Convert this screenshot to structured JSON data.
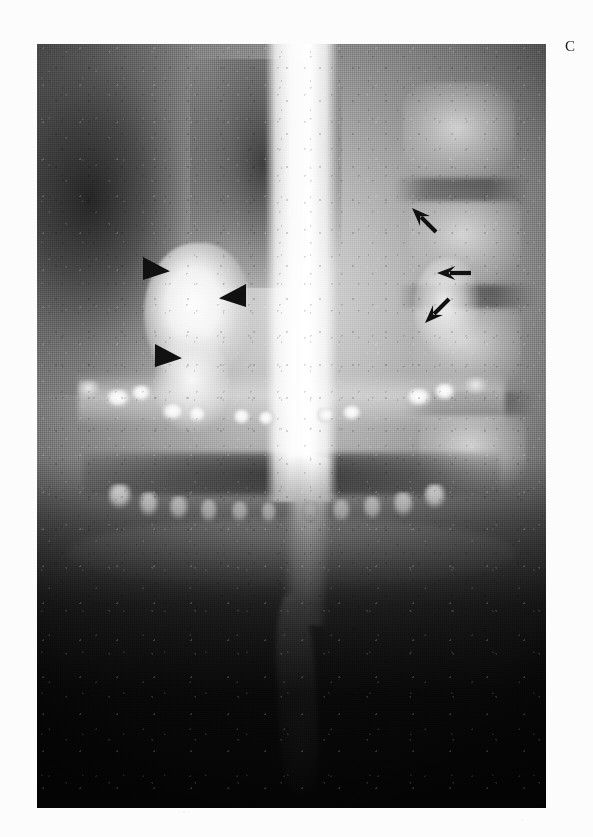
{
  "figure": {
    "panel_label": "C",
    "modality": "panoramic radiograph with barium contrast column",
    "plate": {
      "left": 37,
      "top": 44,
      "width": 509,
      "height": 764,
      "background_color": "#0a0a0a"
    },
    "page_background_color": "#fcfcfc",
    "ink_color": "#111111"
  },
  "annotations": {
    "arrowheads": [
      {
        "name": "arrowhead-1",
        "direction": "right",
        "x": 106,
        "y": 213,
        "size": 27
      },
      {
        "name": "arrowhead-2",
        "direction": "left",
        "x": 182,
        "y": 240,
        "size": 27
      },
      {
        "name": "arrowhead-3",
        "direction": "right",
        "x": 118,
        "y": 300,
        "size": 27
      }
    ],
    "arrows": [
      {
        "name": "arrow-1",
        "direction": "down-left",
        "rotation": 225,
        "x": 370,
        "y": 168,
        "length": 34
      },
      {
        "name": "arrow-2",
        "direction": "left",
        "rotation": 180,
        "x": 400,
        "y": 221,
        "length": 34
      },
      {
        "name": "arrow-3",
        "direction": "up-left",
        "rotation": 135,
        "x": 383,
        "y": 259,
        "length": 34
      }
    ]
  },
  "anatomy": {
    "barium_column": {
      "name": "central-contrast-column",
      "description": "bright vertical barium-filled column descending the midline"
    },
    "left_lesion": {
      "name": "radiodense-lesion-left",
      "description": "well-defined dense lesion marked by three arrowheads"
    },
    "right_lesion": {
      "name": "soft-tissue-density-right",
      "description": "density adjacent to cervical spine marked by three arrows"
    },
    "cervical_spine": {
      "name": "cervical-vertebrae",
      "bodies": [
        {
          "left": 72,
          "top": 5,
          "width": 22,
          "height": 13
        },
        {
          "left": 73,
          "top": 19,
          "width": 22,
          "height": 13
        },
        {
          "left": 74,
          "top": 33,
          "width": 21,
          "height": 13
        },
        {
          "left": 75,
          "top": 47,
          "width": 21,
          "height": 12
        }
      ],
      "gaps": [
        {
          "left": 70,
          "top": 17.5,
          "width": 27,
          "height": 3
        },
        {
          "left": 71,
          "top": 31.5,
          "width": 27,
          "height": 3
        },
        {
          "left": 72,
          "top": 45.5,
          "width": 26,
          "height": 3
        }
      ]
    },
    "upper_teeth": [
      {
        "left": 13.5,
        "top": 45.2,
        "width": 5.0,
        "height": 2.6,
        "bright": true
      },
      {
        "left": 18.4,
        "top": 44.6,
        "width": 4.2,
        "height": 2.4,
        "bright": true
      },
      {
        "left": 24.5,
        "top": 47.0,
        "width": 4.6,
        "height": 2.5,
        "bright": true
      },
      {
        "left": 29.6,
        "top": 47.4,
        "width": 3.8,
        "height": 2.3,
        "bright": true
      },
      {
        "left": 38.5,
        "top": 47.8,
        "width": 3.6,
        "height": 2.2,
        "bright": true
      },
      {
        "left": 43.4,
        "top": 48.0,
        "width": 3.4,
        "height": 2.1,
        "bright": true
      },
      {
        "left": 55.0,
        "top": 47.6,
        "width": 3.6,
        "height": 2.2,
        "bright": true
      },
      {
        "left": 60.0,
        "top": 47.2,
        "width": 3.8,
        "height": 2.3,
        "bright": true
      },
      {
        "left": 72.5,
        "top": 45.0,
        "width": 5.2,
        "height": 2.6,
        "bright": true
      },
      {
        "left": 78.0,
        "top": 44.4,
        "width": 4.4,
        "height": 2.4,
        "bright": true
      },
      {
        "left": 8.0,
        "top": 44.0,
        "width": 4.4,
        "height": 2.4,
        "bright": false
      },
      {
        "left": 84.0,
        "top": 43.6,
        "width": 4.4,
        "height": 2.4,
        "bright": false
      }
    ],
    "lower_teeth": [
      {
        "left": 14.0,
        "top": 57.6,
        "width": 4.6,
        "height": 3.4,
        "bright": true
      },
      {
        "left": 20.0,
        "top": 58.6,
        "width": 4.0,
        "height": 3.4,
        "bright": true
      },
      {
        "left": 26.0,
        "top": 59.2,
        "width": 3.8,
        "height": 3.2,
        "bright": true
      },
      {
        "left": 32.0,
        "top": 59.6,
        "width": 3.6,
        "height": 3.2,
        "bright": true
      },
      {
        "left": 38.2,
        "top": 59.8,
        "width": 3.4,
        "height": 3.0,
        "bright": true
      },
      {
        "left": 44.0,
        "top": 59.9,
        "width": 3.2,
        "height": 3.0,
        "bright": true
      },
      {
        "left": 52.0,
        "top": 59.8,
        "width": 3.4,
        "height": 3.0,
        "bright": true
      },
      {
        "left": 58.0,
        "top": 59.6,
        "width": 3.6,
        "height": 3.2,
        "bright": true
      },
      {
        "left": 64.0,
        "top": 59.2,
        "width": 3.8,
        "height": 3.2,
        "bright": true
      },
      {
        "left": 70.0,
        "top": 58.6,
        "width": 4.0,
        "height": 3.4,
        "bright": true
      },
      {
        "left": 76.0,
        "top": 57.6,
        "width": 4.4,
        "height": 3.4,
        "bright": true
      }
    ]
  }
}
